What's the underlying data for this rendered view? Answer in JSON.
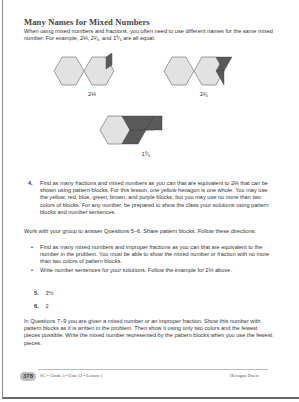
{
  "heading": "Many Names for Mixed Numbers",
  "intro": "When using mixed numbers and fractions, you often need to use different names for the same mixed number. For example, 2⅓, 2²⁄₆, and 1⁸⁄₆ are all equal.",
  "figures": [
    {
      "label": "2⅓",
      "description": "two yellow hexagons and one blue rhombus"
    },
    {
      "label": "2²⁄₆",
      "description": "two yellow hexagons and two green triangles"
    },
    {
      "label": "1⁸⁄₆",
      "description": "one yellow hexagon and eight green triangles"
    }
  ],
  "question4": {
    "number": "4.",
    "text": "Find as many fractions and mixed numbers as you can that are equivalent to 2⅓ that can be shown using pattern blocks. For this lesson, one yellow hexagon is one whole. You may use the yellow, red, blue, green, brown, and purple blocks, but you may use no more than two colors of blocks. For any number, be prepared to show the class your solutions using pattern blocks and number sentences."
  },
  "group_intro": "Work with your group to answer Questions 5–6. Share pattern blocks. Follow these directions:",
  "bullets": [
    "Find as many mixed numbers and improper fractions as you can that are equivalent to the number in the problem. You must be able to show the mixed number or fraction with no more than two colors of pattern blocks.",
    "Write number sentences for your solutions. Follow the example for 2⅓ above."
  ],
  "question5": {
    "number": "5.",
    "text": "3½"
  },
  "question6": {
    "number": "6.",
    "text": "2"
  },
  "questions7_9": "In Questions 7–9 you are given a mixed number or an improper fraction. Show this number with pattern blocks as it is written in the problem. Then show it using only two colors and the fewest pieces possible. Write the mixed number represented by the pattern blocks when you use the fewest pieces.",
  "footer": {
    "page_number": "378",
    "left": "SG • Grade 5 • Unit 12 • Lesson 1",
    "right": "Hexagon Duets"
  },
  "colors": {
    "hexagon_fill": "#e2e2e2",
    "block_fill": "#5a5a5a",
    "outline": "#777777"
  }
}
